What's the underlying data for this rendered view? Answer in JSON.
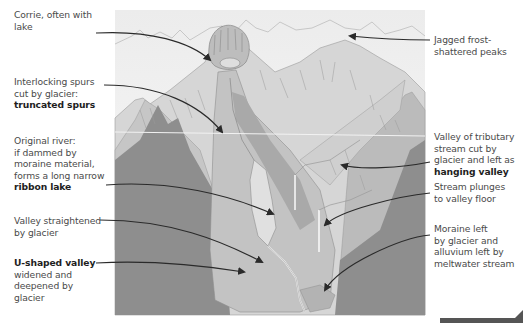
{
  "figure": {
    "colors": {
      "sky": "#f4f4f4",
      "far_mountains": "#e6e6e6",
      "mid_mountains": "#d0d0d0",
      "near_ridge": "#bcbcbc",
      "dark_hills": "#8f8f8f",
      "valley_floor": "#c4c4c4",
      "ribbon_lake": "#dcdcdc",
      "arrow": "#2a2a2a",
      "label_text": "#4a4a4a",
      "label_bold": "#1e1e1e"
    }
  },
  "labels_left": [
    {
      "id": "corrie",
      "lines": [
        "Corrie, often with",
        "lake"
      ],
      "bold": []
    },
    {
      "id": "truncated-spurs",
      "lines": [
        "Interlocking spurs",
        "cut by glacier:"
      ],
      "bold": [
        "truncated spurs"
      ]
    },
    {
      "id": "ribbon-lake",
      "lines": [
        "Original river:",
        "if dammed by",
        "moraine material,",
        "forms a long narrow"
      ],
      "bold": [
        "ribbon lake"
      ]
    },
    {
      "id": "valley-straightened",
      "lines": [
        "Valley straightened",
        "by glacier"
      ],
      "bold": []
    },
    {
      "id": "u-shaped-valley",
      "bold_first": "U-shaped valley",
      "lines": [
        "widened and",
        "deepened by",
        "glacier"
      ]
    }
  ],
  "labels_right": [
    {
      "id": "jagged-peaks",
      "lines": [
        "Jagged frost-",
        "shattered peaks"
      ],
      "bold": []
    },
    {
      "id": "hanging-valley",
      "lines": [
        "Valley of tributary",
        "stream cut by",
        "glacier and left as"
      ],
      "bold": [
        "hanging valley"
      ]
    },
    {
      "id": "stream-plunges",
      "lines": [
        "Stream plunges",
        "to valley floor"
      ],
      "bold": []
    },
    {
      "id": "moraine",
      "lines": [
        "Moraine left",
        "by glacier and",
        "alluvium left by",
        "meltwater stream"
      ],
      "bold": []
    }
  ]
}
